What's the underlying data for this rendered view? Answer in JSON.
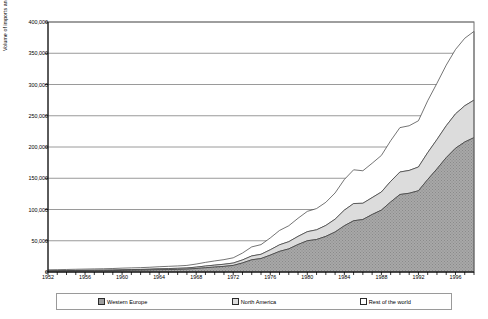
{
  "chart_data": {
    "type": "area",
    "stacked": true,
    "title": "",
    "xlabel": "",
    "ylabel": "Volume of imports and exports (£ million)",
    "ylim": [
      0,
      400000
    ],
    "ytick_labels": [
      "400,000",
      "350,000",
      "300,000",
      "250,000",
      "200,000",
      "150,000",
      "100,000",
      "50,000",
      "0"
    ],
    "ytick_values": [
      400000,
      350000,
      300000,
      250000,
      200000,
      150000,
      100000,
      50000,
      0
    ],
    "xtick_labels": [
      "1952",
      "1956",
      "1960",
      "1964",
      "1968",
      "1972",
      "1976",
      "1980",
      "1984",
      "1988",
      "1992",
      "1996"
    ],
    "xtick_values": [
      1952,
      1956,
      1960,
      1964,
      1968,
      1972,
      1976,
      1980,
      1984,
      1988,
      1992,
      1996
    ],
    "xlim": [
      1952,
      1998
    ],
    "grid": "horizontal",
    "legend_position": "bottom",
    "legend": [
      "Western Europe",
      "North America",
      "Rest of the world"
    ],
    "x": [
      1952,
      1953,
      1954,
      1955,
      1956,
      1957,
      1958,
      1959,
      1960,
      1961,
      1962,
      1963,
      1964,
      1965,
      1966,
      1967,
      1968,
      1969,
      1970,
      1971,
      1972,
      1973,
      1974,
      1975,
      1976,
      1977,
      1978,
      1979,
      1980,
      1981,
      1982,
      1983,
      1984,
      1985,
      1986,
      1987,
      1988,
      1989,
      1990,
      1991,
      1992,
      1993,
      1994,
      1995,
      1996,
      1997,
      1998
    ],
    "series": [
      {
        "name": "Western Europe",
        "color": "#9e9e9e",
        "pattern": "stipple",
        "values": [
          1200,
          1300,
          1450,
          1600,
          1750,
          1900,
          2000,
          2200,
          2500,
          2700,
          2900,
          3200,
          3600,
          3900,
          4200,
          4600,
          5600,
          6800,
          7900,
          9000,
          10500,
          14500,
          19500,
          21500,
          27000,
          33000,
          37000,
          44000,
          50000,
          52000,
          57000,
          64000,
          74000,
          82000,
          84000,
          92000,
          99000,
          112000,
          124000,
          126000,
          130000,
          148000,
          165000,
          183000,
          198000,
          208000,
          215000
        ]
      },
      {
        "name": "North America",
        "color": "#dcdcdc",
        "pattern": "solid-light",
        "values": [
          700,
          750,
          800,
          850,
          900,
          950,
          1000,
          1050,
          1150,
          1200,
          1250,
          1350,
          1500,
          1600,
          1700,
          1850,
          2200,
          2700,
          3100,
          3400,
          3800,
          4800,
          6200,
          6800,
          8500,
          10500,
          11500,
          13000,
          14500,
          15500,
          17500,
          20500,
          25000,
          27500,
          26000,
          27000,
          29000,
          33000,
          36000,
          36500,
          38000,
          43000,
          47000,
          51000,
          55000,
          58000,
          60000
        ]
      },
      {
        "name": "Rest of the world",
        "color": "#ffffff",
        "pattern": "blank",
        "values": [
          1600,
          1700,
          1800,
          1900,
          2000,
          2100,
          2200,
          2350,
          2550,
          2700,
          2850,
          3050,
          3350,
          3550,
          3800,
          4100,
          4900,
          5900,
          6700,
          7400,
          8400,
          11000,
          14500,
          15500,
          19000,
          23000,
          25500,
          29000,
          32500,
          34000,
          37000,
          42000,
          49000,
          54000,
          52000,
          55000,
          58500,
          65000,
          71000,
          71500,
          74000,
          83000,
          90000,
          97000,
          103000,
          108000,
          110000
        ]
      }
    ],
    "totals": [
      3500,
      3750,
      4050,
      4350,
      4650,
      4950,
      5200,
      5600,
      6200,
      6600,
      7000,
      7600,
      8450,
      9050,
      9700,
      10550,
      12700,
      15400,
      17700,
      19800,
      22700,
      30300,
      40200,
      43800,
      54500,
      66500,
      74000,
      86000,
      97000,
      101500,
      111500,
      126500,
      148000,
      163500,
      162000,
      174000,
      186500,
      210000,
      231000,
      234000,
      242000,
      274000,
      302000,
      331000,
      356000,
      374000,
      385000
    ]
  }
}
